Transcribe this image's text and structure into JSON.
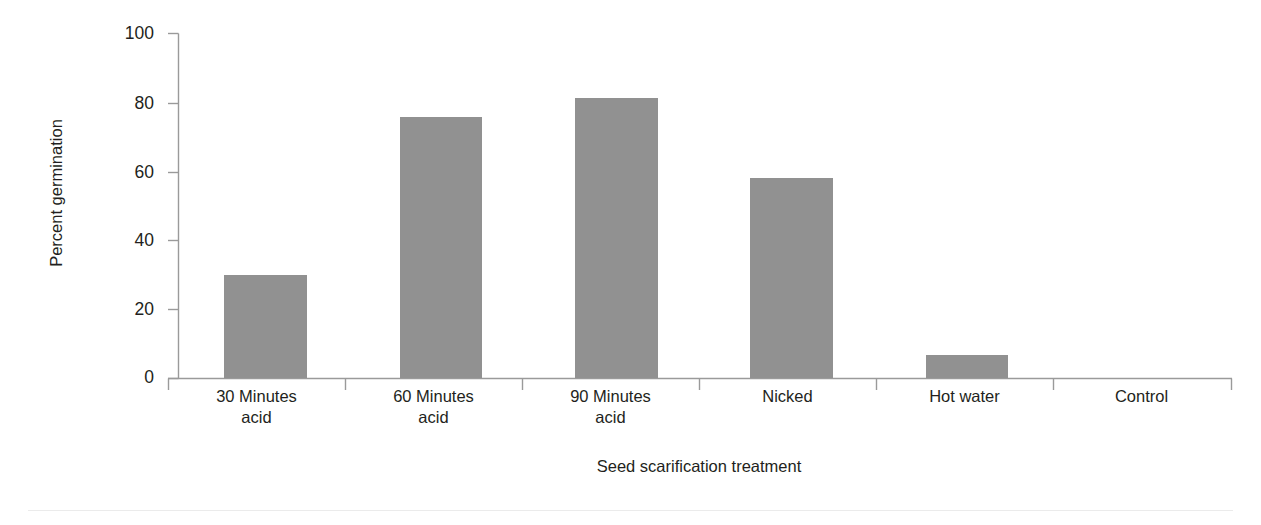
{
  "chart_data": {
    "type": "bar",
    "title": "",
    "xlabel": "Seed scarification treatment",
    "ylabel": "Percent germination",
    "categories": [
      "30 Minutes acid",
      "60 Minutes acid",
      "90 Minutes acid",
      "Nicked",
      "Hot water",
      "Control"
    ],
    "category_lines": [
      [
        "30 Minutes",
        "acid"
      ],
      [
        "60 Minutes",
        "acid"
      ],
      [
        "90 Minutes",
        "acid"
      ],
      [
        "Nicked",
        ""
      ],
      [
        "Hot water",
        ""
      ],
      [
        "Control",
        ""
      ]
    ],
    "values": [
      29.5,
      75,
      80.5,
      57.5,
      6.5,
      0
    ],
    "ylim": [
      0,
      100
    ],
    "yticks": [
      0,
      20,
      40,
      60,
      80,
      100
    ],
    "ytick_labels": [
      "0",
      "20",
      "40",
      "60",
      "80",
      "100"
    ],
    "grid": false,
    "legend": false,
    "bar_color": "#919191",
    "axis_color": "#9a9a9a",
    "text_color": "#231f20"
  },
  "axes": {
    "y_title": "Percent germination",
    "x_title": "Seed scarification treatment"
  }
}
